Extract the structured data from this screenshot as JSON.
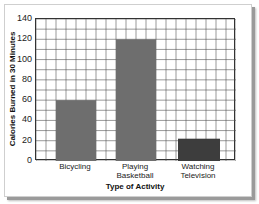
{
  "chart_data": {
    "type": "bar",
    "title": "",
    "categories": [
      "Bicycling",
      "Playing\nBasketball",
      "Watching\nTelevision"
    ],
    "values": [
      60,
      120,
      22
    ],
    "xlabel": "Type of Activity",
    "ylabel": "Calories Burned in 30 Minutes",
    "ylim": [
      0,
      140
    ],
    "yticks": [
      0,
      20,
      40,
      60,
      80,
      100,
      120,
      140
    ],
    "grid": true,
    "legend": null,
    "colors": {
      "bars": [
        "#6e6e6e",
        "#6e6e6e",
        "#3d3d3d"
      ],
      "grid": "#555555",
      "frame_shadow": "#9a9a9a"
    }
  },
  "axis": {
    "y_ticks": [
      {
        "label": "140",
        "value": 140
      },
      {
        "label": "120",
        "value": 120
      },
      {
        "label": "100",
        "value": 100
      },
      {
        "label": "80",
        "value": 80
      },
      {
        "label": "60",
        "value": 60
      },
      {
        "label": "40",
        "value": 40
      },
      {
        "label": "20",
        "value": 20
      },
      {
        "label": "0",
        "value": 0
      }
    ],
    "x_labels": [
      "Bicycling",
      "Playing\nBasketball",
      "Watching\nTelevision"
    ],
    "x_title": "Type of Activity",
    "y_title": "Calories Burned in 30 Minutes"
  }
}
